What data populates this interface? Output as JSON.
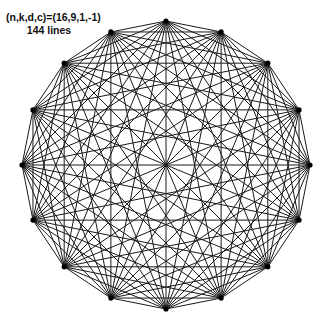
{
  "label": {
    "params": "(n,k,d,c)=(16,9,1,-1)",
    "count": "144 lines"
  },
  "diagram": {
    "type": "string-art-polygon",
    "n": 16,
    "center": [
      166,
      165
    ],
    "radius": 144,
    "line_color": "#1a1a1a",
    "vertex_color": "#000000",
    "chord_skips": [
      1,
      2,
      3,
      4,
      5,
      6,
      7,
      8
    ]
  }
}
